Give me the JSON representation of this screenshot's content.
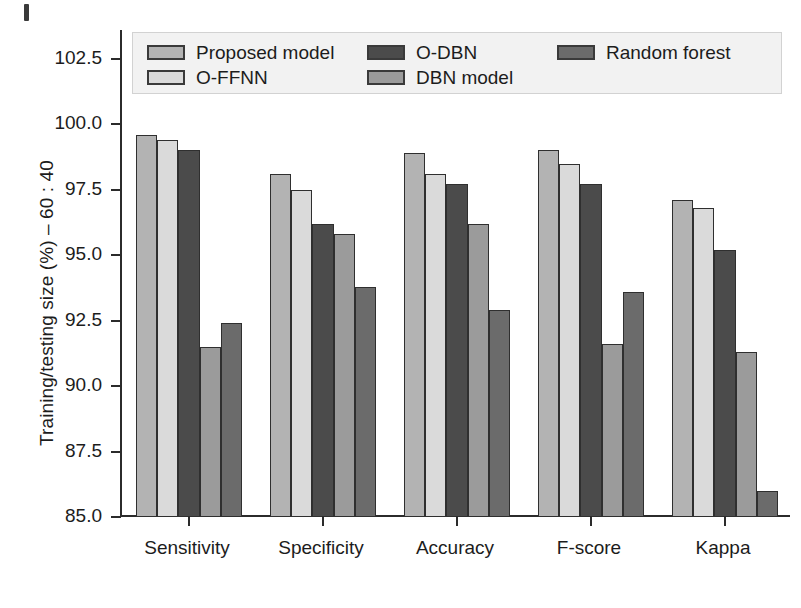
{
  "chart_data": {
    "type": "bar",
    "title": "",
    "xlabel": "",
    "ylabel": "Training/testing size (%) – 60 : 40",
    "ylim": [
      85.0,
      103.6
    ],
    "yticks": [
      85.0,
      87.5,
      90.0,
      92.5,
      95.0,
      97.5,
      100.0,
      102.5
    ],
    "ytick_labels": [
      "85.0",
      "87.5",
      "90.0",
      "92.5",
      "95.0",
      "97.5",
      "100.0",
      "102.5"
    ],
    "grid": false,
    "legend_position": "upper-center-inside",
    "categories": [
      "Sensitivity",
      "Specificity",
      "Accuracy",
      "F-score",
      "Kappa"
    ],
    "series": [
      {
        "name": "Proposed model",
        "color": "#b3b3b3",
        "values": [
          99.6,
          98.1,
          98.9,
          99.0,
          97.1
        ]
      },
      {
        "name": "O-FFNN",
        "color": "#dadada",
        "values": [
          99.4,
          97.5,
          98.1,
          98.5,
          96.8
        ]
      },
      {
        "name": "O-DBN",
        "color": "#4b4b4b",
        "values": [
          99.0,
          96.2,
          97.7,
          97.7,
          95.2
        ]
      },
      {
        "name": "DBN model",
        "color": "#9b9b9b",
        "values": [
          91.5,
          95.8,
          96.2,
          91.6,
          91.3
        ]
      },
      {
        "name": "Random forest",
        "color": "#6b6b6b",
        "values": [
          92.4,
          93.8,
          92.9,
          93.6,
          86.0
        ]
      }
    ]
  },
  "legend": {
    "columns": [
      {
        "entries": [
          "Proposed model",
          "O-FFNN"
        ]
      },
      {
        "entries": [
          "O-DBN",
          "DBN model"
        ]
      },
      {
        "entries": [
          "Random forest"
        ]
      }
    ]
  }
}
